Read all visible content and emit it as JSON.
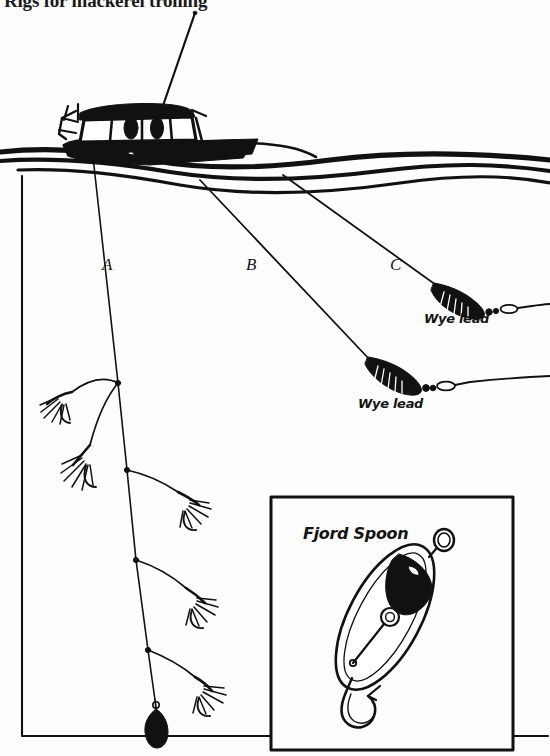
{
  "page": {
    "title": "Rigs for mackerel trolling",
    "background_color": "#fdfdfd",
    "ink_color": "#111111",
    "width": 550,
    "height": 756
  },
  "diagram": {
    "name": "mackerel-trolling-rigs",
    "scene": {
      "vessel": "trolling-boat",
      "water_surface": "wavy-surface-lines",
      "frame": "diagram-border"
    },
    "rigs": [
      {
        "id": "A",
        "label": "A",
        "description": "vertical feathered-lure rig with bottom sinker",
        "lures": "mackerel-feathers",
        "terminal": "teardrop-sinker"
      },
      {
        "id": "B",
        "label": "B",
        "description": "trolling line with wye lead running back",
        "terminal": "wye-lead"
      },
      {
        "id": "C",
        "label": "C",
        "description": "trolling line with wye lead running back",
        "terminal": "wye-lead"
      }
    ],
    "annotations": [
      {
        "id": "wye-lead-c",
        "text": "Wye lead"
      },
      {
        "id": "wye-lead-b",
        "text": "Wye lead"
      }
    ]
  },
  "inset": {
    "name": "fjord-spoon-detail",
    "title": "Fjord Spoon",
    "contents": "oval spoon lure with split ring and treble hook"
  }
}
